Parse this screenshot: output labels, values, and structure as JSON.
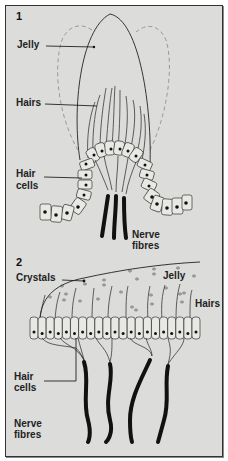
{
  "diagram": {
    "panel1": {
      "number": "1",
      "labels": {
        "jelly": "Jelly",
        "hairs": "Hairs",
        "hair_cells_line1": "Hair",
        "hair_cells_line2": "cells",
        "nerve_fibres_line1": "Nerve",
        "nerve_fibres_line2": "fibres"
      }
    },
    "panel2": {
      "number": "2",
      "labels": {
        "crystals": "Crystals",
        "jelly": "Jelly",
        "hairs": "Hairs",
        "hair_cells_line1": "Hair",
        "hair_cells_line2": "cells",
        "nerve_fibres_line1": "Nerve",
        "nerve_fibres_line2": "fibres"
      }
    },
    "colors": {
      "background": "#dcdcda",
      "ink": "#222222",
      "dashed_outline": "#999999"
    }
  }
}
